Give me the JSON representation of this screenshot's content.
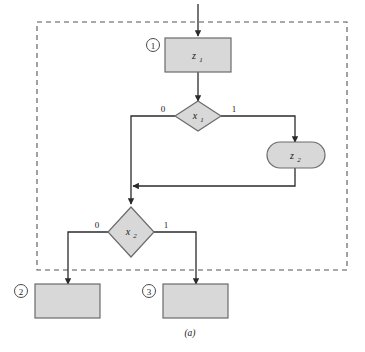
{
  "figure": {
    "caption": "(a)",
    "colors": {
      "node_fill": "#d8d8d8",
      "node_stroke": "#6b6b6b",
      "edge_stroke": "#2b2b2b",
      "dashed_border": "#555555",
      "background": "#ffffff",
      "text": "#1a1a1a"
    },
    "boundary": {
      "name": "dashed-region",
      "style": "dashed"
    }
  },
  "nodes": [
    {
      "id": "z1",
      "shape": "rectangle",
      "label": "z",
      "subscript": "1",
      "marker": "①"
    },
    {
      "id": "x1",
      "shape": "diamond",
      "label": "x",
      "subscript": "1",
      "marker": ""
    },
    {
      "id": "z2",
      "shape": "stadium",
      "label": "z",
      "subscript": "2",
      "marker": ""
    },
    {
      "id": "x2",
      "shape": "diamond",
      "label": "x",
      "subscript": "2",
      "marker": ""
    },
    {
      "id": "out2",
      "shape": "rectangle",
      "label": "",
      "subscript": "",
      "marker": "②"
    },
    {
      "id": "out3",
      "shape": "rectangle",
      "label": "",
      "subscript": "",
      "marker": "③"
    }
  ],
  "edge_labels": {
    "x1_left": "0",
    "x1_right": "1",
    "x2_left": "0",
    "x2_right": "1"
  }
}
